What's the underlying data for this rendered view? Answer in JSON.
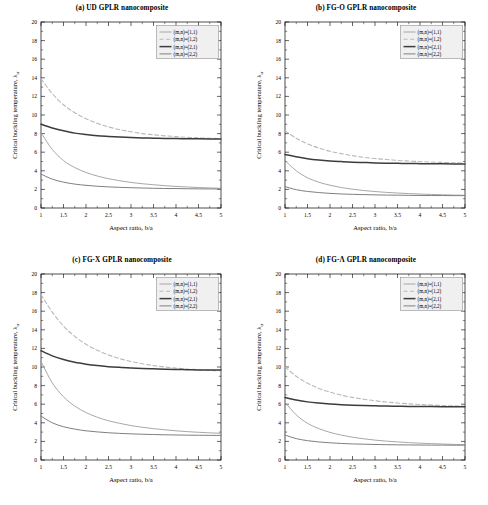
{
  "figure": {
    "axis": {
      "xlabel": "Aspect ratio, b/a",
      "ylabel_main": "Critical buckling temperature, ",
      "ylabel_symbol": "λ",
      "ylabel_sub": "cr",
      "xticks": [
        "1",
        "1.5",
        "2",
        "2.5",
        "3",
        "3.5",
        "4",
        "4.5",
        "5"
      ],
      "yticks": [
        "0",
        "2",
        "4",
        "6",
        "8",
        "10",
        "12",
        "14",
        "16",
        "18",
        "20"
      ],
      "xlim": [
        1,
        5
      ],
      "ylim": [
        0,
        20
      ]
    },
    "legend": {
      "items": [
        {
          "label": "(m,n)=(1,1)",
          "style": "solid-thin",
          "color": "#9a9a9a"
        },
        {
          "label": "(m,n)=(1,2)",
          "style": "dashed",
          "color": "#b5b5b5"
        },
        {
          "label": "(m,n)=(2,1)",
          "style": "solid-thick",
          "color": "#3a3a3a"
        },
        {
          "label": "(m,n)=(2,2)",
          "style": "solid-med",
          "color": "#7d7d7d"
        }
      ]
    },
    "panels": [
      {
        "id": "a",
        "title": "(a) UD GPLR nanocomposite"
      },
      {
        "id": "b",
        "title": "(b) FG-O GPLR nanocomposite"
      },
      {
        "id": "c",
        "title": "(c) FG-X GPLR nanocomposite"
      },
      {
        "id": "d",
        "title": "(d) FG-Λ GPLR nanocomposite"
      }
    ]
  },
  "chart_data": [
    {
      "type": "line",
      "panel": "a",
      "title": "(a) UD GPLR nanocomposite",
      "xlabel": "Aspect ratio, b/a",
      "ylabel": "Critical buckling temperature, λ_cr",
      "xlim": [
        1,
        5
      ],
      "ylim": [
        0,
        20
      ],
      "grid": false,
      "legend_position": "top-right",
      "x": [
        1,
        1.25,
        1.5,
        1.75,
        2,
        2.25,
        2.5,
        2.75,
        3,
        3.25,
        3.5,
        3.75,
        4,
        4.25,
        4.5,
        4.75,
        5
      ],
      "series": [
        {
          "name": "(m,n)=(1,1)",
          "values": [
            8.1,
            6.3,
            5.1,
            4.35,
            3.82,
            3.44,
            3.15,
            2.93,
            2.75,
            2.61,
            2.5,
            2.4,
            2.32,
            2.26,
            2.2,
            2.16,
            2.12
          ]
        },
        {
          "name": "(m,n)=(1,2)",
          "values": [
            13.9,
            12.3,
            11.1,
            10.25,
            9.6,
            9.1,
            8.72,
            8.42,
            8.2,
            8.0,
            7.88,
            7.76,
            7.68,
            7.6,
            7.55,
            7.5,
            7.47
          ]
        },
        {
          "name": "(m,n)=(2,1)",
          "values": [
            9.0,
            8.6,
            8.3,
            8.05,
            7.9,
            7.78,
            7.7,
            7.63,
            7.58,
            7.54,
            7.51,
            7.48,
            7.46,
            7.45,
            7.44,
            7.43,
            7.42
          ]
        },
        {
          "name": "(m,n)=(2,2)",
          "values": [
            3.65,
            3.1,
            2.78,
            2.57,
            2.44,
            2.34,
            2.27,
            2.22,
            2.18,
            2.15,
            2.12,
            2.1,
            2.09,
            2.07,
            2.06,
            2.05,
            2.05
          ]
        }
      ]
    },
    {
      "type": "line",
      "panel": "b",
      "title": "(b) FG-O GPLR nanocomposite",
      "xlabel": "Aspect ratio, b/a",
      "ylabel": "Critical buckling temperature, λ_cr",
      "xlim": [
        1,
        5
      ],
      "ylim": [
        0,
        20
      ],
      "grid": false,
      "legend_position": "top-right",
      "x": [
        1,
        1.25,
        1.5,
        1.75,
        2,
        2.25,
        2.5,
        2.75,
        3,
        3.25,
        3.5,
        3.75,
        4,
        4.25,
        4.5,
        4.75,
        5
      ],
      "series": [
        {
          "name": "(m,n)=(1,1)",
          "values": [
            5.1,
            4.0,
            3.25,
            2.78,
            2.45,
            2.2,
            2.02,
            1.88,
            1.77,
            1.68,
            1.61,
            1.55,
            1.5,
            1.46,
            1.42,
            1.39,
            1.37
          ]
        },
        {
          "name": "(m,n)=(1,2)",
          "values": [
            8.3,
            7.5,
            6.9,
            6.45,
            6.1,
            5.85,
            5.63,
            5.45,
            5.32,
            5.22,
            5.12,
            5.05,
            4.99,
            4.94,
            4.9,
            4.86,
            4.83
          ]
        },
        {
          "name": "(m,n)=(2,1)",
          "values": [
            5.75,
            5.5,
            5.3,
            5.16,
            5.06,
            4.99,
            4.93,
            4.89,
            4.85,
            4.82,
            4.8,
            4.78,
            4.77,
            4.76,
            4.75,
            4.74,
            4.73
          ]
        },
        {
          "name": "(m,n)=(2,2)",
          "values": [
            2.3,
            1.97,
            1.78,
            1.66,
            1.57,
            1.51,
            1.47,
            1.44,
            1.41,
            1.39,
            1.38,
            1.36,
            1.35,
            1.34,
            1.34,
            1.33,
            1.33
          ]
        }
      ]
    },
    {
      "type": "line",
      "panel": "c",
      "title": "(c) FG-X GPLR nanocomposite",
      "xlabel": "Aspect ratio, b/a",
      "ylabel": "Critical buckling temperature, λ_cr",
      "xlim": [
        1,
        5
      ],
      "ylim": [
        0,
        20
      ],
      "grid": false,
      "legend_position": "top-right",
      "x": [
        1,
        1.25,
        1.5,
        1.75,
        2,
        2.25,
        2.5,
        2.75,
        3,
        3.25,
        3.5,
        3.75,
        4,
        4.25,
        4.5,
        4.75,
        5
      ],
      "series": [
        {
          "name": "(m,n)=(1,1)",
          "values": [
            10.6,
            8.3,
            6.8,
            5.8,
            5.1,
            4.6,
            4.22,
            3.94,
            3.7,
            3.52,
            3.37,
            3.25,
            3.14,
            3.05,
            2.98,
            2.92,
            2.87
          ]
        },
        {
          "name": "(m,n)=(1,2)",
          "values": [
            17.8,
            15.9,
            14.4,
            13.3,
            12.45,
            11.8,
            11.3,
            10.9,
            10.6,
            10.35,
            10.15,
            10.0,
            9.88,
            9.78,
            9.7,
            9.63,
            9.58
          ]
        },
        {
          "name": "(m,n)=(2,1)",
          "values": [
            11.75,
            11.2,
            10.8,
            10.5,
            10.3,
            10.15,
            10.04,
            9.96,
            9.89,
            9.84,
            9.8,
            9.76,
            9.73,
            9.71,
            9.69,
            9.68,
            9.67
          ]
        },
        {
          "name": "(m,n)=(2,2)",
          "values": [
            4.72,
            4.0,
            3.58,
            3.32,
            3.14,
            3.02,
            2.93,
            2.86,
            2.81,
            2.77,
            2.74,
            2.71,
            2.69,
            2.67,
            2.66,
            2.65,
            2.64
          ]
        }
      ]
    },
    {
      "type": "line",
      "panel": "d",
      "title": "(d) FG-Λ GPLR nanocomposite",
      "xlabel": "Aspect ratio, b/a",
      "ylabel": "Critical buckling temperature, λ_cr",
      "xlim": [
        1,
        5
      ],
      "ylim": [
        0,
        20
      ],
      "grid": false,
      "legend_position": "top-right",
      "x": [
        1,
        1.25,
        1.5,
        1.75,
        2,
        2.25,
        2.5,
        2.75,
        3,
        3.25,
        3.5,
        3.75,
        4,
        4.25,
        4.5,
        4.75,
        5
      ],
      "series": [
        {
          "name": "(m,n)=(1,1)",
          "values": [
            6.2,
            4.85,
            3.95,
            3.38,
            2.97,
            2.68,
            2.45,
            2.28,
            2.14,
            2.03,
            1.95,
            1.87,
            1.81,
            1.76,
            1.72,
            1.68,
            1.65
          ]
        },
        {
          "name": "(m,n)=(1,2)",
          "values": [
            10.0,
            9.0,
            8.25,
            7.7,
            7.3,
            6.98,
            6.73,
            6.53,
            6.37,
            6.24,
            6.13,
            6.04,
            5.97,
            5.91,
            5.86,
            5.82,
            5.78
          ]
        },
        {
          "name": "(m,n)=(2,1)",
          "values": [
            6.72,
            6.45,
            6.25,
            6.12,
            6.02,
            5.95,
            5.9,
            5.86,
            5.83,
            5.8,
            5.78,
            5.76,
            5.75,
            5.74,
            5.73,
            5.72,
            5.72
          ]
        },
        {
          "name": "(m,n)=(2,2)",
          "values": [
            2.68,
            2.3,
            2.08,
            1.94,
            1.85,
            1.78,
            1.73,
            1.7,
            1.67,
            1.65,
            1.63,
            1.62,
            1.61,
            1.6,
            1.6,
            1.59,
            1.59
          ]
        }
      ]
    }
  ]
}
